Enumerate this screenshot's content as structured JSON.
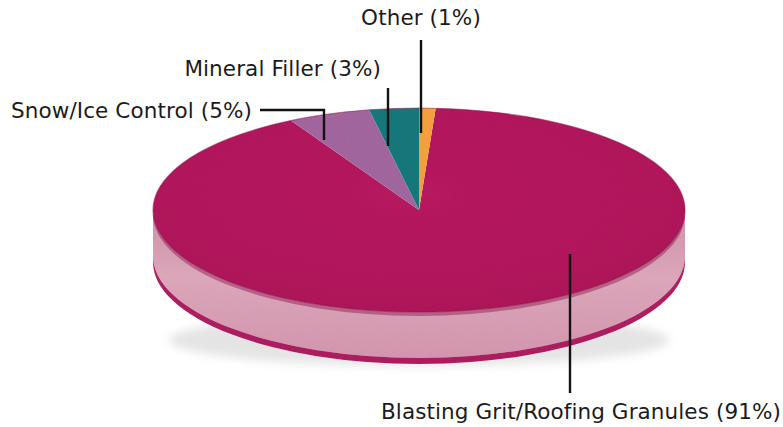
{
  "chart_data": {
    "type": "pie",
    "title": "",
    "subtitle": "",
    "xlabel": "",
    "ylabel": "",
    "legend_position": "none",
    "grid": false,
    "three_d": true,
    "categories": [
      "Blasting Grit/Roofing Granules",
      "Snow/Ice Control",
      "Mineral Filler",
      "Other"
    ],
    "values": [
      91,
      5,
      3,
      1
    ],
    "value_unit": "%",
    "colors": [
      "#B3165C",
      "#A3679F",
      "#14797C",
      "#F6A23E"
    ],
    "slices": [
      {
        "name": "Blasting Grit/Roofing Granules",
        "value": 91,
        "label": "Blasting Grit/Roofing Granules (91%)",
        "percent_text": "91%",
        "color": "#B3165C",
        "side_color": "#DCA3B7",
        "label_position": "bottom-right"
      },
      {
        "name": "Snow/Ice Control",
        "value": 5,
        "label": "Snow/Ice Control (5%)",
        "percent_text": "5%",
        "color": "#A3679F",
        "side_color": "#A3679F",
        "label_position": "left"
      },
      {
        "name": "Mineral Filler",
        "value": 3,
        "label": "Mineral Filler (3%)",
        "percent_text": "3%",
        "color": "#14797C",
        "side_color": "#14797C",
        "label_position": "top-left"
      },
      {
        "name": "Other",
        "value": 1,
        "label": "Other (1%)",
        "percent_text": "1%",
        "color": "#F6A23E",
        "side_color": "#F6A23E",
        "label_position": "top"
      }
    ],
    "background_color": "#FFFFFF",
    "leader_line_color": "#121212",
    "label_text_color": "#1B1B1B"
  },
  "labels": {
    "other": "Other (1%)",
    "mineral_filler": "Mineral Filler (3%)",
    "snow_ice_control": "Snow/Ice Control (5%)",
    "blasting_grit": "Blasting Grit/Roofing Granules (91%)"
  }
}
